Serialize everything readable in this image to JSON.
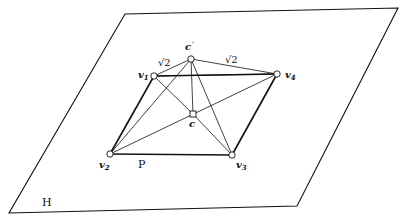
{
  "plane": {
    "label": "H",
    "corners": [
      [
        125,
        14
      ],
      [
        398,
        8
      ],
      [
        297,
        206
      ],
      [
        9,
        213
      ]
    ],
    "label_pos": [
      42,
      206
    ]
  },
  "polygon": {
    "label": "P",
    "label_pos": [
      138,
      168
    ],
    "edges": [
      [
        "v1",
        "v2"
      ],
      [
        "v2",
        "v3"
      ],
      [
        "v3",
        "v4"
      ],
      [
        "v1",
        "v4"
      ]
    ]
  },
  "points": {
    "c_prime": {
      "label": "c'",
      "x": 191,
      "y": 59,
      "label_pos": [
        185,
        50
      ]
    },
    "v1": {
      "label": "v1",
      "x": 154,
      "y": 76,
      "label_pos": [
        138,
        78
      ]
    },
    "v4": {
      "label": "v4",
      "x": 277,
      "y": 74,
      "label_pos": [
        285,
        78
      ]
    },
    "c": {
      "label": "c",
      "x": 193,
      "y": 114,
      "label_pos": [
        189,
        127
      ]
    },
    "v2": {
      "label": "v2",
      "x": 110,
      "y": 154,
      "label_pos": [
        99,
        168
      ]
    },
    "v3": {
      "label": "v3",
      "x": 232,
      "y": 155,
      "label_pos": [
        236,
        168
      ]
    }
  },
  "edge_labels": [
    {
      "text": "√2",
      "x": 158,
      "y": 66
    },
    {
      "text": "√2",
      "x": 225,
      "y": 63
    }
  ],
  "thin_edges": [
    [
      "c_prime",
      "v1"
    ],
    [
      "c_prime",
      "v4"
    ],
    [
      "c_prime",
      "c"
    ],
    [
      "c_prime",
      "v2"
    ],
    [
      "c_prime",
      "v3"
    ],
    [
      "v1",
      "c"
    ],
    [
      "c",
      "v3"
    ],
    [
      "v2",
      "v4"
    ],
    [
      "v1",
      "v4"
    ]
  ],
  "colors": {
    "stroke": "#111111",
    "background": "#ffffff"
  }
}
